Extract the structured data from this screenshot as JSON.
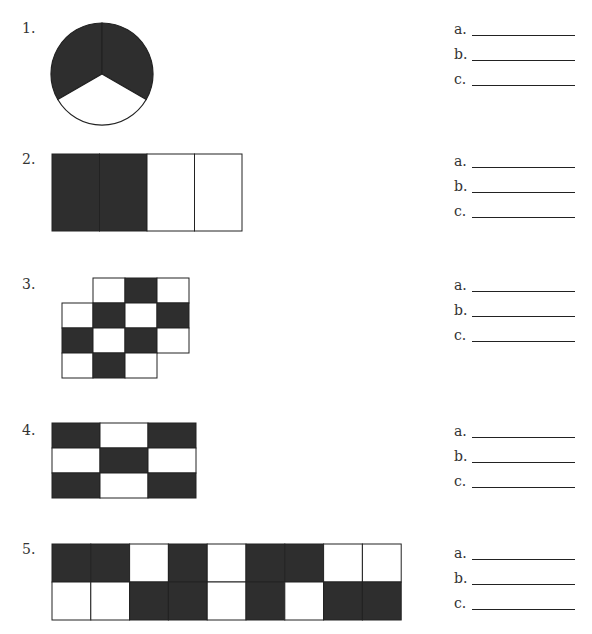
{
  "problems": [
    {
      "number": "1.",
      "shape": "circle",
      "parts": 3,
      "shaded": 2,
      "answers": [
        {
          "label": "a."
        },
        {
          "label": "b."
        },
        {
          "label": "c."
        }
      ]
    },
    {
      "number": "2.",
      "shape": "rectangle",
      "rows": 1,
      "cols": 4,
      "grid": [
        [
          1,
          1,
          0,
          0
        ]
      ],
      "answers": [
        {
          "label": "a."
        },
        {
          "label": "b."
        },
        {
          "label": "c."
        }
      ]
    },
    {
      "number": "3.",
      "shape": "irregular-grid",
      "cells": [
        [
          null,
          0,
          1,
          0
        ],
        [
          0,
          1,
          0,
          1
        ],
        [
          1,
          0,
          1,
          0
        ],
        [
          0,
          1,
          0,
          null
        ]
      ],
      "answers": [
        {
          "label": "a."
        },
        {
          "label": "b."
        },
        {
          "label": "c."
        }
      ]
    },
    {
      "number": "4.",
      "shape": "rectangle",
      "rows": 3,
      "cols": 3,
      "grid": [
        [
          1,
          0,
          1
        ],
        [
          0,
          1,
          0
        ],
        [
          1,
          0,
          1
        ]
      ],
      "answers": [
        {
          "label": "a."
        },
        {
          "label": "b."
        },
        {
          "label": "c."
        }
      ]
    },
    {
      "number": "5.",
      "shape": "rectangle",
      "rows": 2,
      "cols": 9,
      "grid": [
        [
          1,
          1,
          0,
          1,
          0,
          1,
          1,
          0,
          0
        ],
        [
          0,
          0,
          1,
          1,
          0,
          1,
          0,
          1,
          1
        ]
      ],
      "answers": [
        {
          "label": "a."
        },
        {
          "label": "b."
        },
        {
          "label": "c."
        }
      ]
    }
  ],
  "colors": {
    "shaded": "#2e2e2e",
    "unshaded": "#ffffff",
    "stroke": "#222222"
  }
}
